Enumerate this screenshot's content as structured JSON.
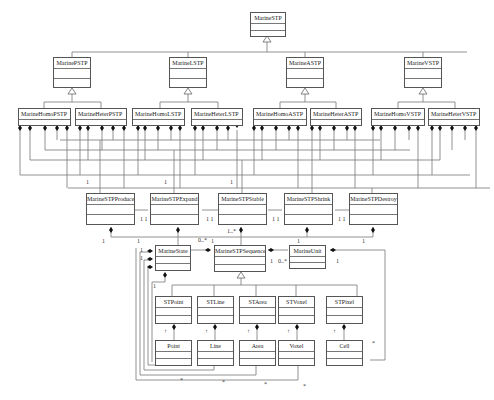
{
  "diagram": {
    "type": "UML class diagram",
    "classes": {
      "root": "MarineSTP",
      "p": "MarinePSTP",
      "l": "MarineLSTP",
      "a": "MarineASTP",
      "v": "MarineVSTP",
      "homoP": "MarineHomoPSTP",
      "heterP": "MarineHeterPSTP",
      "homoL": "MarineHomoLSTP",
      "heterL": "MarineHeterLSTP",
      "homoA": "MarineHomoASTP",
      "heterA": "MarineHeterASTP",
      "homoV": "MarineHomoVSTP",
      "heterV": "MarineHeterVSTP",
      "produce": "MarineSTPProduce",
      "expand": "MarineSTPExpand",
      "stable": "MarineSTPStable",
      "shrink": "MarineSTPShrink",
      "destroy": "MarineSTPDestroy",
      "state": "MarineState",
      "sequence": "MarineSTPSequence",
      "unit": "MarineUnit",
      "stPoint": "STPoint",
      "stLine": "STLine",
      "stArea": "STArea",
      "stVoxel": "STVoxel",
      "stPixel": "STPixel",
      "point": "Point",
      "line": "Line",
      "area": "Area",
      "voxel": "Voxel",
      "cell": "Cell"
    },
    "multiplicities": {
      "one": "1",
      "eleven": "1 1",
      "oneMany": "1..*",
      "zeroMany": "0..*",
      "star": "*",
      "arrowUp": "↑"
    }
  }
}
